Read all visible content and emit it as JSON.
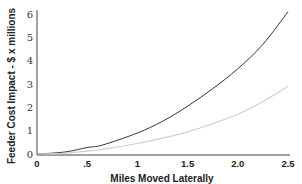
{
  "chart_data": {
    "type": "line",
    "title": "",
    "xlabel": "Miles Moved Laterally",
    "ylabel": "Feeder Cost Impact - $ x millions",
    "xlim": [
      0,
      2.5
    ],
    "ylim": [
      0,
      6
    ],
    "x_ticks": [
      {
        "value": 0,
        "label": "0"
      },
      {
        "value": 0.5,
        "label": ".5"
      },
      {
        "value": 1.0,
        "label": "1"
      },
      {
        "value": 1.5,
        "label": "1.5"
      },
      {
        "value": 2.0,
        "label": "2.0"
      },
      {
        "value": 2.5,
        "label": "2.5"
      }
    ],
    "y_ticks": [
      {
        "value": 0,
        "label": "0"
      },
      {
        "value": 1,
        "label": "1"
      },
      {
        "value": 2,
        "label": "2"
      },
      {
        "value": 3,
        "label": "3"
      },
      {
        "value": 4,
        "label": "4"
      },
      {
        "value": 5,
        "label": "5"
      },
      {
        "value": 6,
        "label": "6"
      }
    ],
    "grid": false,
    "legend": null,
    "x": [
      0,
      0.1,
      0.3,
      0.5,
      0.65,
      1.0,
      1.25,
      1.5,
      1.75,
      2.0,
      2.25,
      2.5
    ],
    "series": [
      {
        "name": "upper curve",
        "color": "#333333",
        "values": [
          0,
          0.02,
          0.1,
          0.28,
          0.38,
          0.9,
          1.4,
          2.05,
          2.8,
          3.65,
          4.7,
          6.1
        ]
      },
      {
        "name": "lower curve",
        "color": "#cfcfcf",
        "values": [
          0,
          0.01,
          0.04,
          0.12,
          0.2,
          0.45,
          0.68,
          0.95,
          1.3,
          1.7,
          2.25,
          2.9
        ]
      }
    ]
  }
}
